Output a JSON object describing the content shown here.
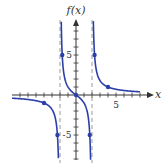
{
  "chart_data": {
    "type": "line",
    "title": "",
    "ylabel": "f(x)",
    "xlabel": "x",
    "function": "f(x) = 3x / (x^2 - 4)",
    "xlim": [
      -8,
      9.5
    ],
    "ylim": [
      -8.1,
      9.4
    ],
    "xticks_every": 1,
    "yticks_every": 1,
    "xtick_labels": [
      {
        "value": 5,
        "label": "5"
      }
    ],
    "ytick_labels": [
      {
        "value": 5,
        "label": "5"
      },
      {
        "value": -5,
        "label": "-5"
      }
    ],
    "vertical_asymptotes": [
      -2,
      2
    ],
    "horizontal_asymptote": 0,
    "grid": false,
    "series": [
      {
        "name": "left-branch",
        "domain": [
          -8,
          -2.05
        ],
        "color": "#2b3fa8"
      },
      {
        "name": "middle-branch",
        "domain": [
          -1.95,
          1.95
        ],
        "color": "#2b3fa8"
      },
      {
        "name": "right-branch",
        "domain": [
          2.05,
          8
        ],
        "color": "#2b3fa8"
      }
    ],
    "points": [
      {
        "x": -4,
        "y": -1
      },
      {
        "x": -2.32,
        "y": -5
      },
      {
        "x": -1.72,
        "y": 5
      },
      {
        "x": 0,
        "y": 0
      },
      {
        "x": 1.72,
        "y": -5
      },
      {
        "x": 2.32,
        "y": 5
      },
      {
        "x": 4,
        "y": 1
      }
    ]
  },
  "colors": {
    "curve": "#2b3fa8",
    "axis": "#333333",
    "asymptote": "#9a9a9a"
  },
  "labels": {
    "y_axis": "f(x)",
    "x_axis": "x",
    "x5": "5",
    "y5": "5",
    "yneg5": "-5"
  }
}
